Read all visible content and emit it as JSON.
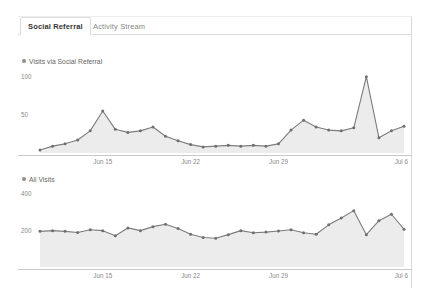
{
  "tabs": [
    {
      "label": "Social Referral",
      "active": true
    },
    {
      "label": "Activity Stream",
      "active": false
    }
  ],
  "colors": {
    "line": "#7d7d7d",
    "fill": "#ececed",
    "marker": "#6f6f6f",
    "axis": "#c9c9c9",
    "text": "#8a8a8a",
    "panel_border": "#d8d8d8",
    "tab_active_text": "#333333",
    "tab_inactive_text": "#888888"
  },
  "chart_data": [
    {
      "type": "area",
      "title": "Visits via Social Referral",
      "legend": [
        "Visits via Social Referral"
      ],
      "legend_position": "top-left",
      "xlabel": "",
      "ylabel": "",
      "grid": false,
      "ylim": [
        0,
        110
      ],
      "yticks": [
        50,
        100
      ],
      "ytick_labels": [
        "50",
        "100"
      ],
      "xticks": [
        "Jun 15",
        "Jun 22",
        "Jun 29",
        "Jul 6"
      ],
      "xtick_positions": [
        5,
        12,
        19,
        26
      ],
      "x": [
        0,
        1,
        2,
        3,
        4,
        5,
        6,
        7,
        8,
        9,
        10,
        11,
        12,
        13,
        14,
        15,
        16,
        17,
        18,
        19,
        20,
        21,
        22,
        23,
        24,
        25,
        26,
        27,
        28,
        29
      ],
      "values": [
        4,
        9,
        12,
        17,
        29,
        55,
        31,
        27,
        29,
        34,
        22,
        16,
        11,
        8,
        9,
        10,
        9,
        10,
        9,
        12,
        30,
        43,
        34,
        30,
        29,
        33,
        100,
        20,
        29,
        35
      ]
    },
    {
      "type": "area",
      "title": "All Visits",
      "legend": [
        "All Visits"
      ],
      "legend_position": "top-left",
      "xlabel": "",
      "ylabel": "",
      "grid": false,
      "ylim": [
        0,
        440
      ],
      "yticks": [
        200,
        400
      ],
      "ytick_labels": [
        "200",
        "400"
      ],
      "xticks": [
        "Jun 15",
        "Jun 22",
        "Jun 29",
        "Jul 6"
      ],
      "xtick_positions": [
        5,
        12,
        19,
        26
      ],
      "x": [
        0,
        1,
        2,
        3,
        4,
        5,
        6,
        7,
        8,
        9,
        10,
        11,
        12,
        13,
        14,
        15,
        16,
        17,
        18,
        19,
        20,
        21,
        22,
        23,
        24,
        25,
        26,
        27,
        28,
        29
      ],
      "values": [
        196,
        200,
        196,
        190,
        205,
        200,
        172,
        215,
        200,
        222,
        235,
        212,
        180,
        162,
        158,
        178,
        200,
        188,
        192,
        198,
        205,
        188,
        180,
        232,
        270,
        310,
        178,
        255,
        290,
        208
      ]
    }
  ]
}
